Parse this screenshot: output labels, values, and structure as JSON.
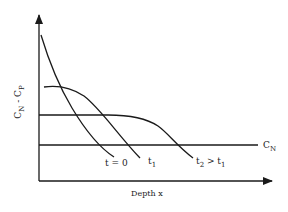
{
  "diagram": {
    "y_axis_label": {
      "main1": "C",
      "sub1": "N",
      "sep": " - ",
      "main2": "C",
      "sub2": "P"
    },
    "x_axis_label": "Depth x",
    "reference_line_label": {
      "main": "C",
      "sub": "N"
    },
    "curves": [
      {
        "id": "t0",
        "label_main": "t = 0",
        "label_sub": ""
      },
      {
        "id": "t1",
        "label_main": "t",
        "label_sub": "1"
      },
      {
        "id": "t2",
        "label_main": "t",
        "label_sub": "2",
        "label_rel": " > ",
        "label_main2": "t",
        "label_sub2": "1"
      }
    ],
    "stroke_color": "#1a1a1a",
    "background_color": "#ffffff"
  }
}
